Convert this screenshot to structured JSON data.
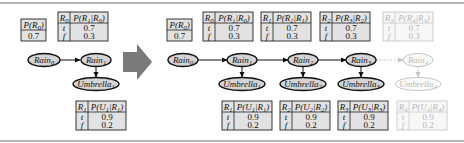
{
  "colors": {
    "node_fill": "#d4d4d4",
    "table_fill": "#e2e2e2",
    "arrow": "#7a7a7a",
    "faded": "#c4c4c4",
    "rule": "#9a9a9a"
  },
  "left": {
    "prior": {
      "header": "P(R0)",
      "value": "0.7"
    },
    "transition": {
      "parent": "R0",
      "header": "P(R1|R0)",
      "rows": [
        {
          "cond": "t",
          "value": "0.7"
        },
        {
          "cond": "f",
          "value": "0.3"
        }
      ]
    },
    "nodes": {
      "rain0": "Rain0",
      "rain1": "Rain1",
      "umbrella1": "Umbrella1"
    },
    "sensor": {
      "parent": "R1",
      "header": "P(U1|R1)",
      "rows": [
        {
          "cond": "t",
          "value": "0.9"
        },
        {
          "cond": "f",
          "value": "0.2"
        }
      ]
    }
  },
  "arrow_icon": "right-arrow-icon",
  "right": {
    "prior": {
      "header": "P(R0)",
      "value": "0.7"
    },
    "rain_nodes": [
      "Rain0",
      "Rain1",
      "Rain2",
      "Rain3",
      "Rain4"
    ],
    "umbrella_nodes": [
      "Umbrella1",
      "Umbrella2",
      "Umbrella3",
      "Umbrella4"
    ],
    "transitions": [
      {
        "parent": "R0",
        "header": "P(R1|R0)",
        "rows": [
          {
            "cond": "t",
            "value": "0.7"
          },
          {
            "cond": "f",
            "value": "0.3"
          }
        ],
        "faded": false
      },
      {
        "parent": "R1",
        "header": "P(R2|R1)",
        "rows": [
          {
            "cond": "t",
            "value": "0.7"
          },
          {
            "cond": "f",
            "value": "0.3"
          }
        ],
        "faded": false
      },
      {
        "parent": "R2",
        "header": "P(R3|R2)",
        "rows": [
          {
            "cond": "t",
            "value": "0.7"
          },
          {
            "cond": "f",
            "value": "0.3"
          }
        ],
        "faded": false
      },
      {
        "parent": "R3",
        "header": "P(R4|R3)",
        "rows": [
          {
            "cond": "t",
            "value": "0.7"
          },
          {
            "cond": "f",
            "value": "0.3"
          }
        ],
        "faded": true
      }
    ],
    "sensors": [
      {
        "parent": "R1",
        "header": "P(U1|R1)",
        "rows": [
          {
            "cond": "t",
            "value": "0.9"
          },
          {
            "cond": "f",
            "value": "0.2"
          }
        ],
        "faded": false
      },
      {
        "parent": "R2",
        "header": "P(U2|R2)",
        "rows": [
          {
            "cond": "t",
            "value": "0.9"
          },
          {
            "cond": "f",
            "value": "0.2"
          }
        ],
        "faded": false
      },
      {
        "parent": "R3",
        "header": "P(U3|R3)",
        "rows": [
          {
            "cond": "t",
            "value": "0.9"
          },
          {
            "cond": "f",
            "value": "0.2"
          }
        ],
        "faded": false
      },
      {
        "parent": "R4",
        "header": "P(U4|R4)",
        "rows": [
          {
            "cond": "t",
            "value": "0.9"
          },
          {
            "cond": "f",
            "value": "0.2"
          }
        ],
        "faded": true
      }
    ]
  }
}
